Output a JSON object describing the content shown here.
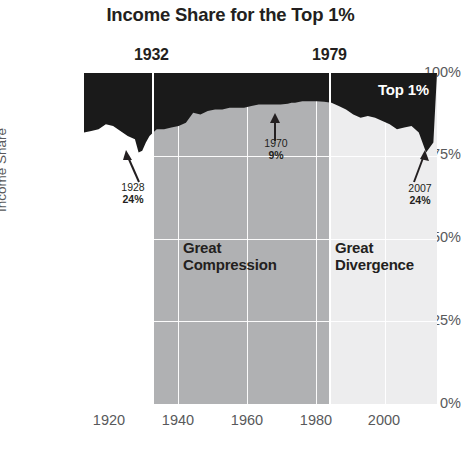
{
  "chart_data": {
    "type": "area",
    "title": "Income Share for the Top 1%",
    "xlabel": "",
    "ylabel": "Income Share",
    "xlim": [
      1913,
      2010
    ],
    "ylim": [
      0,
      100
    ],
    "grid": true,
    "legend_position": "inside-top-right",
    "series_label": "Top 1%",
    "note": "Dark region is drawn from the top of the axis down to (100 - top1%); visible dark band thickness equals the Top 1% income share.",
    "xticks": [
      "1920",
      "1940",
      "1960",
      "1980",
      "2000"
    ],
    "xtick_values": [
      1920,
      1940,
      1960,
      1980,
      2000
    ],
    "yticks": [
      "0%",
      "25%",
      "50%",
      "75%",
      "100%"
    ],
    "ytick_values": [
      0,
      25,
      50,
      75,
      100
    ],
    "x": [
      1913,
      1915,
      1917,
      1919,
      1921,
      1923,
      1925,
      1927,
      1928,
      1929,
      1930,
      1931,
      1932,
      1933,
      1935,
      1937,
      1939,
      1941,
      1943,
      1945,
      1947,
      1949,
      1951,
      1953,
      1955,
      1957,
      1959,
      1961,
      1963,
      1965,
      1967,
      1969,
      1970,
      1971,
      1973,
      1975,
      1977,
      1979,
      1981,
      1983,
      1985,
      1987,
      1989,
      1991,
      1993,
      1995,
      1997,
      1999,
      2001,
      2003,
      2005,
      2007,
      2009
    ],
    "top1_share": [
      18,
      17.5,
      17,
      15.5,
      16,
      17.5,
      19,
      20,
      24,
      23.5,
      21,
      19,
      18,
      17,
      17,
      16.5,
      16,
      15,
      12,
      12.5,
      11.5,
      11,
      11,
      10.5,
      10.5,
      10.5,
      10,
      9.5,
      9.5,
      9.5,
      9.5,
      9.3,
      9,
      9,
      8.5,
      8.5,
      8.5,
      8.7,
      9,
      10,
      11,
      12.5,
      13.5,
      13,
      13.5,
      14.5,
      15.5,
      17,
      16.5,
      16,
      18,
      24,
      21
    ],
    "eras": [
      {
        "name": "Great Compression",
        "start": 1932,
        "end": 1979,
        "shade": "#b0b1b3"
      },
      {
        "name": "Great Divergence",
        "start": 1979,
        "end": 2010,
        "shade": "#ededee"
      }
    ],
    "era_markers": [
      {
        "label": "1932",
        "year": 1932
      },
      {
        "label": "1979",
        "year": 1979
      }
    ],
    "annotations": [
      {
        "year": "1928",
        "value": "24%",
        "x": 1928,
        "y": 24
      },
      {
        "year": "1970",
        "value": "9%",
        "x": 1970,
        "y": 9
      },
      {
        "year": "2007",
        "value": "24%",
        "x": 2007,
        "y": 24
      }
    ],
    "colors": {
      "area_fill": "#1a1a1a",
      "compression_band": "#b0b1b3",
      "divergence_band": "#ededee",
      "gridline": "#ffffff",
      "tick_text": "#58595b",
      "title_text": "#231f20"
    }
  },
  "title": "Income Share for the Top 1%",
  "axis": {
    "y_label": "Income Share",
    "y_ticks": [
      "100%",
      "75%",
      "50%",
      "25%",
      "0%"
    ],
    "x_ticks": [
      "1920",
      "1940",
      "1960",
      "1980",
      "2000"
    ]
  },
  "series_label": "Top 1%",
  "eras": {
    "compression_label": "Great\nCompression",
    "compression_line1": "Great",
    "compression_line2": "Compression",
    "divergence_line1": "Great",
    "divergence_line2": "Divergence",
    "marker_1932": "1932",
    "marker_1979": "1979"
  },
  "annotations": {
    "a1": {
      "year": "1928",
      "value": "24%"
    },
    "a2": {
      "year": "1970",
      "value": "9%"
    },
    "a3": {
      "year": "2007",
      "value": "24%"
    }
  }
}
